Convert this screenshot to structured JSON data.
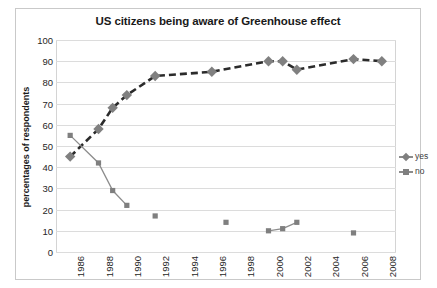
{
  "chart_data": {
    "type": "scatter",
    "title": "US citizens being aware of Greenhouse effect",
    "xlabel": "",
    "ylabel": "percentages of respondents",
    "ylim": [
      0,
      100
    ],
    "xlim": [
      1985,
      2009
    ],
    "ytick_labels": [
      "100",
      "90",
      "80",
      "70",
      "60",
      "50",
      "40",
      "30",
      "20",
      "10",
      "0"
    ],
    "ytick_values": [
      100,
      90,
      80,
      70,
      60,
      50,
      40,
      30,
      20,
      10,
      0
    ],
    "xtick_labels": [
      "1986",
      "1988",
      "1990",
      "1992",
      "1994",
      "1996",
      "1998",
      "2000",
      "2002",
      "2004",
      "2006",
      "2008"
    ],
    "xtick_values": [
      1986,
      1988,
      1990,
      1992,
      1994,
      1996,
      1998,
      2000,
      2002,
      2004,
      2006,
      2008
    ],
    "grid": true,
    "legend_position": "right",
    "series": [
      {
        "name": "yes",
        "marker": "diamond",
        "color": "#808080",
        "line_style": "dashed",
        "points": [
          {
            "x": 1986,
            "y": 45
          },
          {
            "x": 1988,
            "y": 58
          },
          {
            "x": 1989,
            "y": 68
          },
          {
            "x": 1990,
            "y": 74
          },
          {
            "x": 1992,
            "y": 83
          },
          {
            "x": 1996,
            "y": 85
          },
          {
            "x": 2000,
            "y": 90
          },
          {
            "x": 2001,
            "y": 90
          },
          {
            "x": 2002,
            "y": 86
          },
          {
            "x": 2006,
            "y": 91
          },
          {
            "x": 2008,
            "y": 90
          }
        ]
      },
      {
        "name": "no",
        "marker": "square",
        "color": "#7f7f7f",
        "line_style": "solid",
        "points": [
          {
            "x": 1986,
            "y": 55
          },
          {
            "x": 1988,
            "y": 42
          },
          {
            "x": 1989,
            "y": 29
          },
          {
            "x": 1990,
            "y": 22
          },
          {
            "x": 1992,
            "y": 17
          },
          {
            "x": 1997,
            "y": 14
          },
          {
            "x": 2000,
            "y": 10
          },
          {
            "x": 2001,
            "y": 11
          },
          {
            "x": 2002,
            "y": 14
          },
          {
            "x": 2006,
            "y": 9
          }
        ]
      }
    ]
  },
  "legend": {
    "items": [
      {
        "label": "yes"
      },
      {
        "label": "no"
      }
    ]
  },
  "colors": {
    "series_yes": "#808080",
    "series_no": "#7f7f7f",
    "grid": "#dcdcdc",
    "text": "#262626",
    "border": "#c9c9c9"
  }
}
